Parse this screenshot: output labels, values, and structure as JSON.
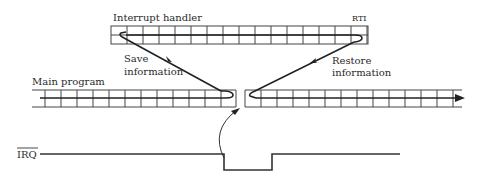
{
  "diagram": {
    "labels": {
      "interrupt_handler": "Interrupt handler",
      "rti": "RTI",
      "save_line1": "Save",
      "save_line2": "information",
      "restore_line1": "Restore",
      "restore_line2": "information",
      "main_program": "Main program",
      "irq": "IRQ"
    },
    "colors": {
      "line": "#333333",
      "background": "#ffffff"
    }
  }
}
